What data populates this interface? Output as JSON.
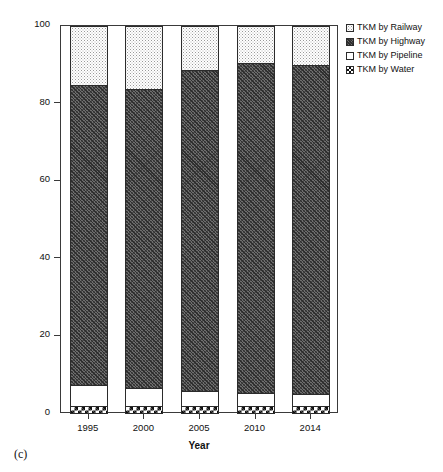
{
  "panel": {
    "caption": "(c)"
  },
  "chart_data": {
    "type": "bar",
    "subtype": "stacked-100-percent",
    "title": "",
    "subtitle": "",
    "xlabel": "Year",
    "ylabel": "Percentage (%)",
    "categories": [
      "1995",
      "2000",
      "2005",
      "2010",
      "2014"
    ],
    "ylim": [
      0,
      100
    ],
    "yticks": [
      0,
      20,
      40,
      60,
      80,
      100
    ],
    "ytick_labels": [
      "0",
      "20",
      "40",
      "60",
      "80",
      "100"
    ],
    "grid": false,
    "legend_position": "top-right-outside",
    "stack_order_bottom_to_top": [
      "TKM by Water",
      "TKM by Pipeline",
      "TKM by Highway",
      "TKM by Railway"
    ],
    "series": [
      {
        "name": "TKM by Railway",
        "pattern": "light-stipple",
        "values": [
          15.2,
          16.2,
          11.3,
          9.5,
          10.0
        ],
        "cumulative_top": [
          100.0,
          100.0,
          100.0,
          100.0,
          100.0
        ]
      },
      {
        "name": "TKM by Highway",
        "pattern": "dark-crosshatch",
        "values": [
          77.3,
          77.1,
          82.8,
          85.1,
          84.8
        ],
        "cumulative_top": [
          84.8,
          83.8,
          88.7,
          90.5,
          90.0
        ]
      },
      {
        "name": "TKM by Pipeline",
        "pattern": "white-blank",
        "values": [
          5.4,
          4.6,
          3.8,
          3.3,
          3.1
        ],
        "cumulative_top": [
          7.5,
          6.7,
          5.9,
          5.4,
          5.2
        ]
      },
      {
        "name": "TKM by Water",
        "pattern": "checkerboard",
        "values": [
          2.1,
          2.1,
          2.1,
          2.1,
          2.1
        ],
        "cumulative_top": [
          2.1,
          2.1,
          2.1,
          2.1,
          2.1
        ]
      }
    ]
  },
  "legend": {
    "items": [
      {
        "label": "TKM by Railway",
        "pattern": "light-stipple"
      },
      {
        "label": "TKM by Highway",
        "pattern": "dark-crosshatch"
      },
      {
        "label": "TKM by Pipeline",
        "pattern": "white-blank"
      },
      {
        "label": "TKM by Water",
        "pattern": "checkerboard"
      }
    ]
  }
}
